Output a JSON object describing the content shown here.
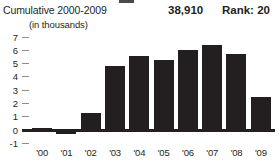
{
  "header": {
    "cumulative_label": "Cumulative 2000-2009",
    "total_value": "38,910",
    "rank_value": "Rank: 20",
    "units_label": "(in thousands)"
  },
  "colors": {
    "bar": "#231f20",
    "baseline": "#231f20",
    "tick": "#8d8d8d",
    "text": "#231f20",
    "background": "#ffffff"
  },
  "chart_data": {
    "type": "bar",
    "title": "Cumulative 2000-2009",
    "subtitle": "(in thousands)",
    "xlabel": "",
    "ylabel": "(in thousands)",
    "categories": [
      "'00",
      "'01",
      "'02",
      "'03",
      "'04",
      "'05",
      "'06",
      "'07",
      "'08",
      "'09"
    ],
    "values": [
      0.05,
      -0.3,
      1.3,
      4.8,
      5.6,
      5.3,
      6.0,
      6.4,
      5.7,
      2.5
    ],
    "ylim": [
      -1,
      7
    ],
    "ytick_labels": [
      "7",
      "6",
      "5",
      "4",
      "3",
      "2",
      "1",
      "0",
      "-1"
    ],
    "ytick_values": [
      7,
      6,
      5,
      4,
      3,
      2,
      1,
      0,
      -1
    ],
    "grid": false,
    "legend": false,
    "annotations": {
      "total": "38,910",
      "rank": "Rank: 20"
    }
  }
}
